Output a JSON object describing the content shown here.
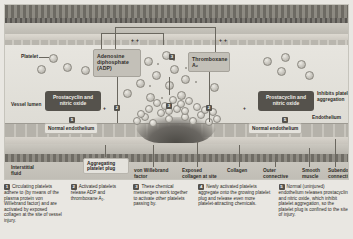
{
  "figure": {
    "anatomy_labels": {
      "vessel_lumen": "Vessel lumen",
      "endothelium": "Endothelium",
      "normal_endothelium_left": "Normal endothelium",
      "normal_endothelium_right": "Normal endothelium",
      "interstitial_fluid": "Interstitial fluid",
      "platelet": "Platelet",
      "aggregating_platelet_plug": "Aggregating platelet plug",
      "von_willebrand_factor": "von Willebrand factor",
      "exposed_collagen": "Exposed collagen at site of vessel injury",
      "collagen": "Collagen",
      "outer_connective_tissue": "Outer connective tissue layer",
      "smooth_muscle": "Smooth muscle",
      "subendothelial_connective_tissue": "Subendothelial connective tissue"
    },
    "chemical_boxes": {
      "adp": "Adenosine diphosphate (ADP)",
      "thromboxane": "Thromboxane A₂",
      "prostacyclin_left": "Prostacyclin and nitric oxide",
      "prostacyclin_right": "Prostacyclin and nitric oxide"
    },
    "annotations": {
      "inhibits": "Inhibits platelet aggregation",
      "plus_sign": "+",
      "marker_2": "2",
      "marker_3": "3",
      "marker_5": "5"
    },
    "colors": {
      "panel_background": "#d9d7d0",
      "lumen": "#e7e5df",
      "outer_connective_tissue": "#6d6a63",
      "dark_box": "#55524c",
      "chem_box": "#c3c0b8",
      "injury_site": "#4c4a45"
    }
  },
  "legend": {
    "steps": [
      {
        "number": "1",
        "text": "Circulating platelets adhere to (by means of the plasma protein von Willebrand factor) and are activated by exposed collagen at the site of vessel injury."
      },
      {
        "number": "2",
        "text": "Activated platelets release ADP and thromboxane A₂."
      },
      {
        "number": "3",
        "text": "These chemical messengers work together to activate other platelets passing by."
      },
      {
        "number": "4",
        "text": "Newly activated platelets aggregate onto the growing platelet plug and release even more platelet-attracting chemicals."
      },
      {
        "number": "5",
        "text": "Normal (uninjured) endothelium releases prostacyclin and nitric oxide, which inhibit platelet aggregation, so the platelet plug is confined to the site of injury."
      }
    ]
  }
}
